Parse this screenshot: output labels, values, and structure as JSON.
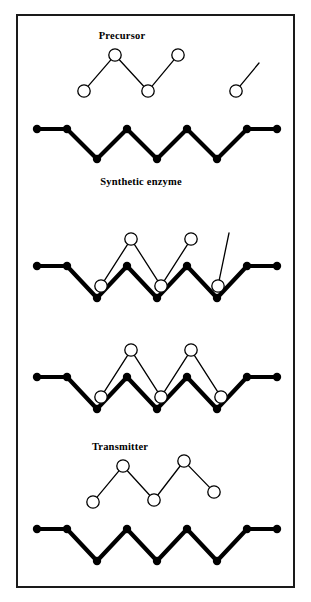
{
  "figure": {
    "type": "process-diagram",
    "panel_count": 5,
    "background_color": "#ffffff",
    "line_color": "#000000",
    "border_color": "#1a1a1a",
    "frame": {
      "x": 16,
      "y": 14,
      "width": 279,
      "height": 574
    }
  },
  "labels": {
    "precursor": "Precursor",
    "synthetic_enzyme": "Synthetic enzyme",
    "transmitter": "Transmitter"
  },
  "label_positions": {
    "precursor": {
      "x": 120,
      "y": 37
    },
    "synthetic_enzyme": {
      "x": 139,
      "y": 183
    },
    "transmitter": {
      "x": 118,
      "y": 448
    }
  },
  "style": {
    "enzyme_stroke_width": 4.2,
    "molecule_stroke_width": 1.3,
    "filled_node_radius": 4.2,
    "open_node_radius": 6.2,
    "open_node_fill": "#ffffff"
  },
  "panels": [
    {
      "id": "panel-1-precursor",
      "caption_key": "precursor",
      "molecules": [
        {
          "name": "precursor-chain",
          "node_type": "open",
          "nodes": [
            {
              "x": 82,
              "y": 89
            },
            {
              "x": 113,
              "y": 53
            },
            {
              "x": 146,
              "y": 89
            },
            {
              "x": 176,
              "y": 53
            }
          ]
        },
        {
          "name": "free-fragment",
          "node_type": "open",
          "nodes": [
            {
              "x": 234,
              "y": 89
            }
          ],
          "tail": {
            "x": 257,
            "y": 61
          }
        }
      ]
    },
    {
      "id": "panel-2-enzyme",
      "caption_key": "synthetic_enzyme",
      "enzyme": {
        "name": "synthetic-enzyme-chain",
        "node_type": "filled",
        "nodes": [
          {
            "x": 35,
            "y": 127
          },
          {
            "x": 65,
            "y": 127
          },
          {
            "x": 95,
            "y": 157
          },
          {
            "x": 125,
            "y": 127
          },
          {
            "x": 155,
            "y": 157
          },
          {
            "x": 185,
            "y": 127
          },
          {
            "x": 215,
            "y": 157
          },
          {
            "x": 245,
            "y": 127
          },
          {
            "x": 275,
            "y": 127
          }
        ]
      }
    },
    {
      "id": "panel-3-binding",
      "caption_key": null,
      "enzyme": {
        "name": "synthetic-enzyme-chain",
        "node_type": "filled",
        "nodes": [
          {
            "x": 35,
            "y": 264
          },
          {
            "x": 65,
            "y": 264
          },
          {
            "x": 95,
            "y": 296
          },
          {
            "x": 125,
            "y": 264
          },
          {
            "x": 155,
            "y": 296
          },
          {
            "x": 185,
            "y": 264
          },
          {
            "x": 215,
            "y": 296
          },
          {
            "x": 245,
            "y": 264
          },
          {
            "x": 275,
            "y": 264
          }
        ]
      },
      "molecules": [
        {
          "name": "precursor-chain",
          "node_type": "open",
          "nodes": [
            {
              "x": 99,
              "y": 284
            },
            {
              "x": 129,
              "y": 237
            },
            {
              "x": 159,
              "y": 284
            },
            {
              "x": 189,
              "y": 237
            }
          ]
        },
        {
          "name": "free-fragment",
          "node_type": "open",
          "nodes": [
            {
              "x": 216,
              "y": 284
            }
          ],
          "tail": {
            "x": 227,
            "y": 231
          }
        }
      ]
    },
    {
      "id": "panel-4-assembled",
      "caption_key": null,
      "enzyme": {
        "name": "synthetic-enzyme-chain",
        "node_type": "filled",
        "nodes": [
          {
            "x": 35,
            "y": 375
          },
          {
            "x": 65,
            "y": 375
          },
          {
            "x": 95,
            "y": 407
          },
          {
            "x": 125,
            "y": 375
          },
          {
            "x": 155,
            "y": 407
          },
          {
            "x": 185,
            "y": 375
          },
          {
            "x": 215,
            "y": 407
          },
          {
            "x": 245,
            "y": 375
          },
          {
            "x": 275,
            "y": 375
          }
        ]
      },
      "molecules": [
        {
          "name": "transmitter-chain",
          "node_type": "open",
          "nodes": [
            {
              "x": 99,
              "y": 395
            },
            {
              "x": 129,
              "y": 348
            },
            {
              "x": 159,
              "y": 395
            },
            {
              "x": 189,
              "y": 348
            },
            {
              "x": 219,
              "y": 395
            }
          ]
        }
      ]
    },
    {
      "id": "panel-5-transmitter",
      "caption_key": "transmitter",
      "molecules": [
        {
          "name": "transmitter-chain",
          "node_type": "open",
          "nodes": [
            {
              "x": 91,
              "y": 500
            },
            {
              "x": 121,
              "y": 464
            },
            {
              "x": 152,
              "y": 498
            },
            {
              "x": 182,
              "y": 459
            },
            {
              "x": 212,
              "y": 490
            }
          ]
        }
      ]
    },
    {
      "id": "panel-6-enzyme-released",
      "caption_key": null,
      "enzyme": {
        "name": "synthetic-enzyme-chain",
        "node_type": "filled",
        "nodes": [
          {
            "x": 35,
            "y": 527
          },
          {
            "x": 65,
            "y": 527
          },
          {
            "x": 95,
            "y": 559
          },
          {
            "x": 125,
            "y": 527
          },
          {
            "x": 155,
            "y": 559
          },
          {
            "x": 185,
            "y": 527
          },
          {
            "x": 215,
            "y": 559
          },
          {
            "x": 245,
            "y": 527
          },
          {
            "x": 275,
            "y": 527
          }
        ]
      }
    }
  ]
}
